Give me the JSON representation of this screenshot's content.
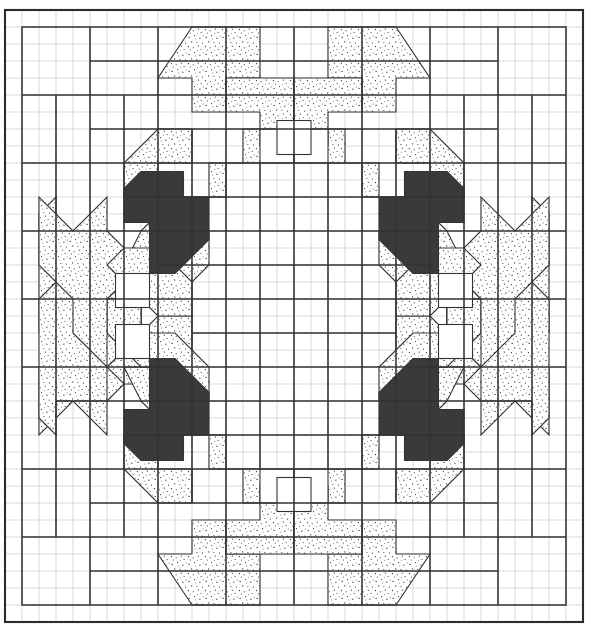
{
  "document": {
    "kind": "quilt-pattern-diagram",
    "title": "Medallion Quilt Block Layout",
    "width": 590,
    "height": 638
  },
  "canvas": {
    "background": "#ffffff",
    "origin_x": 5,
    "origin_y": 10,
    "grid_width": 578,
    "grid_height": 612
  },
  "grid": {
    "name": "fine-graph-grid",
    "cell_size": 17,
    "columns": 34,
    "rows": 36,
    "line_color": "#c9c9c9",
    "line_width": 0.7,
    "visible": true
  },
  "border": {
    "name": "outer-border",
    "color": "#2b2b2b",
    "line_width": 2.0
  },
  "styles": {
    "block_line_color": "#333333",
    "block_line_width": 1.6,
    "patch_line_color": "#333333",
    "patch_line_width": 1.1,
    "stipple_fill": "#ffffff",
    "stipple_dot_color": "#1a1a1a",
    "dark_fill": "#3a3a3a",
    "plain_fill": "#ffffff"
  },
  "legend": {
    "stipple_label": "stippled patch",
    "dark_label": "dark patch",
    "plain_label": "background patch"
  },
  "blocks": {
    "unit": 17,
    "block_span": 6,
    "rows": 5,
    "columns": 5,
    "note": "Heavy outlines subdivide the quilt top into blocks and sashing strips."
  },
  "motifs": {
    "corner_count": 4,
    "dark_patch_count": 4,
    "small_open_square_count": 6,
    "symmetry": "4-fold mirror symmetry about the vertical and horizontal center axes"
  },
  "chart_data": {
    "type": "table",
    "categories": [
      "stippled",
      "dark",
      "plain"
    ],
    "values": [
      118,
      4,
      206
    ],
    "xlabel": "patch type",
    "ylabel": "patch count"
  }
}
